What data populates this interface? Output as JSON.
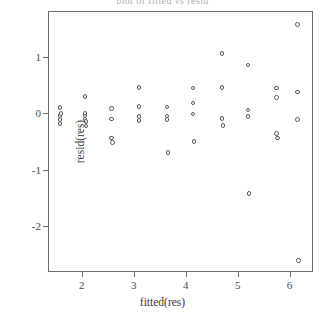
{
  "chart_data": {
    "type": "scatter",
    "title": "plot of fitted vs resid",
    "xlabel": "fitted(res)",
    "ylabel": "resid(res)",
    "xlim": [
      1.35,
      6.45
    ],
    "ylim": [
      -2.82,
      1.82
    ],
    "xticks": [
      2,
      3,
      4,
      5,
      6
    ],
    "yticks": [
      1,
      0,
      -1,
      -2
    ],
    "xtick_labels": [
      "2",
      "3",
      "4",
      "5",
      "6"
    ],
    "ytick_labels": [
      "1",
      "0",
      "-1",
      "-2"
    ],
    "grid": false,
    "legend": false,
    "marker": "open-circle",
    "marker_color": "#59595f",
    "points": [
      {
        "x": 1.56,
        "y": 0.12
      },
      {
        "x": 1.56,
        "y": -0.02
      },
      {
        "x": 1.56,
        "y": -0.09
      },
      {
        "x": 1.56,
        "y": -0.16
      },
      {
        "x": 1.58,
        "y": 0.02
      },
      {
        "x": 2.04,
        "y": 0.32
      },
      {
        "x": 2.04,
        "y": 0.02
      },
      {
        "x": 2.04,
        "y": -0.03
      },
      {
        "x": 2.04,
        "y": -0.08
      },
      {
        "x": 2.06,
        "y": -0.13
      },
      {
        "x": 2.06,
        "y": -0.21
      },
      {
        "x": 2.55,
        "y": 0.1
      },
      {
        "x": 2.55,
        "y": -0.08
      },
      {
        "x": 2.55,
        "y": -0.42
      },
      {
        "x": 2.57,
        "y": -0.5
      },
      {
        "x": 3.08,
        "y": 0.48
      },
      {
        "x": 3.08,
        "y": 0.14
      },
      {
        "x": 3.08,
        "y": -0.04
      },
      {
        "x": 3.08,
        "y": -0.11
      },
      {
        "x": 3.62,
        "y": 0.13
      },
      {
        "x": 3.62,
        "y": -0.03
      },
      {
        "x": 3.62,
        "y": -0.09
      },
      {
        "x": 3.64,
        "y": -0.68
      },
      {
        "x": 4.12,
        "y": 0.47
      },
      {
        "x": 4.12,
        "y": 0.2
      },
      {
        "x": 4.12,
        "y": 0.01
      },
      {
        "x": 4.14,
        "y": -0.48
      },
      {
        "x": 4.68,
        "y": 1.08
      },
      {
        "x": 4.68,
        "y": 0.48
      },
      {
        "x": 4.68,
        "y": -0.07
      },
      {
        "x": 4.7,
        "y": -0.2
      },
      {
        "x": 5.18,
        "y": 0.88
      },
      {
        "x": 5.18,
        "y": 0.08
      },
      {
        "x": 5.18,
        "y": -0.04
      },
      {
        "x": 5.2,
        "y": -1.41
      },
      {
        "x": 5.73,
        "y": 0.47
      },
      {
        "x": 5.73,
        "y": 0.3
      },
      {
        "x": 5.73,
        "y": -0.34
      },
      {
        "x": 5.75,
        "y": -0.42
      },
      {
        "x": 6.13,
        "y": 1.6
      },
      {
        "x": 6.13,
        "y": 0.4
      },
      {
        "x": 6.13,
        "y": -0.09
      },
      {
        "x": 6.15,
        "y": -2.6
      }
    ]
  }
}
